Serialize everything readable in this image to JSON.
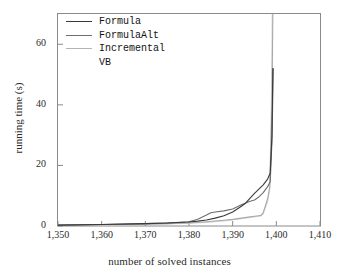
{
  "chart_data": {
    "type": "line",
    "title": "",
    "xlabel": "number of solved instances",
    "ylabel": "running time (s)",
    "xlim": [
      1350,
      1410
    ],
    "ylim": [
      0,
      70
    ],
    "xticks": [
      1350,
      1360,
      1370,
      1380,
      1390,
      1400,
      1410
    ],
    "xticklabels": [
      "1,350",
      "1,360",
      "1,370",
      "1,380",
      "1,390",
      "1,400",
      "1,410"
    ],
    "yticks": [
      0,
      20,
      40,
      60
    ],
    "yticklabels": [
      "0",
      "20",
      "40",
      "60"
    ],
    "grid": false,
    "legend_position": "upper left",
    "series": [
      {
        "name": "Formula",
        "color": "#3a3a3a",
        "x": [
          1350,
          1360,
          1370,
          1375,
          1380,
          1382,
          1384,
          1386,
          1388,
          1390,
          1392,
          1393,
          1394,
          1395,
          1396,
          1397,
          1398,
          1398.6,
          1399,
          1399.2
        ],
        "y": [
          0.3,
          0.5,
          0.8,
          1.0,
          1.3,
          1.6,
          2.0,
          2.6,
          3.4,
          4.6,
          6.5,
          7.6,
          9.2,
          10.8,
          12.2,
          13.6,
          15.5,
          17.5,
          30.0,
          52.0
        ]
      },
      {
        "name": "FormulaAlt",
        "color": "#6e6e6e",
        "x": [
          1350,
          1360,
          1370,
          1375,
          1380,
          1382,
          1384,
          1385,
          1386,
          1388,
          1390,
          1392,
          1394,
          1395,
          1396,
          1397,
          1398,
          1398.6,
          1399,
          1399.3
        ],
        "y": [
          0.3,
          0.5,
          0.8,
          1.0,
          1.4,
          2.2,
          3.6,
          4.4,
          4.6,
          5.0,
          5.6,
          7.0,
          8.2,
          8.6,
          9.6,
          11.0,
          13.0,
          14.6,
          28.0,
          52.0
        ]
      },
      {
        "name": "Incremental",
        "color": "#a8a8a8",
        "x": [
          1350,
          1360,
          1370,
          1375,
          1380,
          1384,
          1388,
          1390,
          1392,
          1394,
          1395,
          1396,
          1396.5,
          1397,
          1398,
          1398.5,
          1399,
          1399.2
        ],
        "y": [
          0.2,
          0.4,
          0.6,
          0.8,
          1.0,
          1.4,
          1.9,
          2.2,
          2.6,
          3.0,
          3.2,
          3.4,
          3.5,
          4.4,
          9.0,
          13.0,
          40.0,
          70.0
        ]
      },
      {
        "name": "VB",
        "color": "#d8d8d8",
        "x": [
          1350,
          1360,
          1370,
          1375,
          1380,
          1384,
          1388,
          1390,
          1392,
          1394,
          1395,
          1396,
          1396.5,
          1397,
          1398,
          1398.5,
          1398.9,
          1399.05
        ],
        "y": [
          0.2,
          0.35,
          0.55,
          0.7,
          0.9,
          1.2,
          1.7,
          2.0,
          2.4,
          2.8,
          3.0,
          3.2,
          3.3,
          4.0,
          8.0,
          12.0,
          45.0,
          70.0
        ]
      }
    ]
  },
  "legend": {
    "entries": [
      {
        "label": "Formula",
        "color": "#3a3a3a",
        "swatch": true
      },
      {
        "label": "FormulaAlt",
        "color": "#6e6e6e",
        "swatch": true
      },
      {
        "label": "Incremental",
        "color": "#b4b4b4",
        "swatch": true
      },
      {
        "label": "VB",
        "color": "#f2f2f2",
        "swatch": false
      }
    ]
  },
  "axes": {
    "frame_color": "#8a8a8a"
  }
}
